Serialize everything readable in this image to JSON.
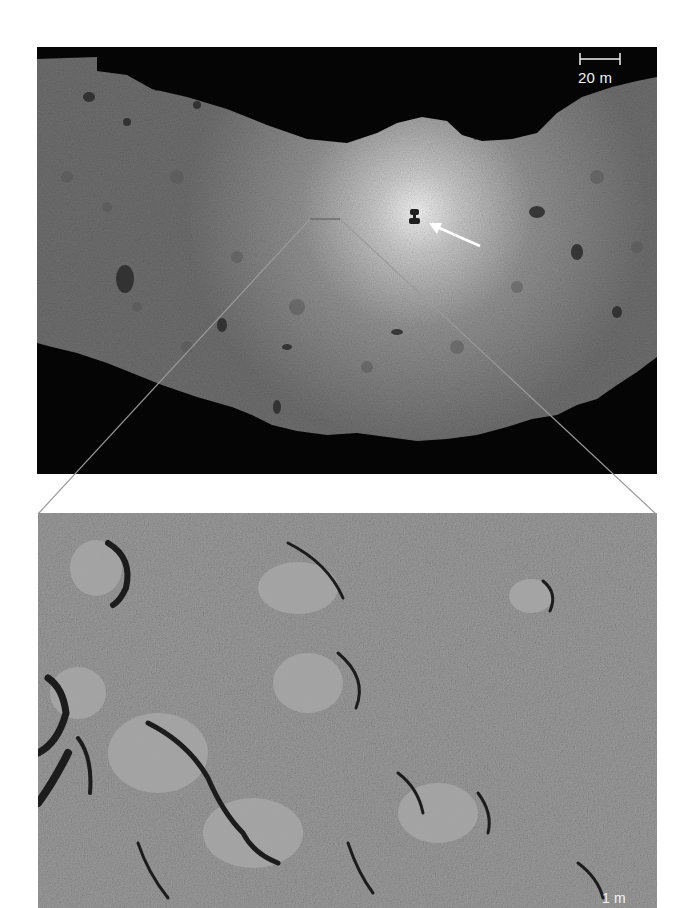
{
  "figure": {
    "top_image": {
      "description": "Asteroid surface view with bright spacecraft-shadow region",
      "scale_bar": {
        "label": "20 m"
      },
      "arrow": {
        "color": "#ffffff",
        "points_to": "spacecraft-shadow"
      },
      "colors": {
        "space": "#050505",
        "surface": "#8a8a8a",
        "highlight": "#e8e8e8"
      }
    },
    "bottom_image": {
      "description": "Close-up of boulder field within inset region",
      "scale_bar": {
        "label": "1 m"
      },
      "colors": {
        "surface": "#8c8c8c",
        "shadow": "#1a1a1a"
      }
    },
    "inset_guides": {
      "color": "#9a9a9a"
    }
  }
}
